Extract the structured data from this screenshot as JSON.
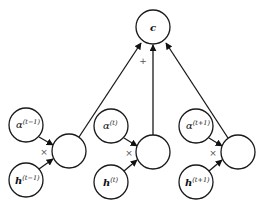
{
  "diagram": {
    "title": "",
    "output_node": {
      "label": "c",
      "cx": 153,
      "cy": 27,
      "r": 17
    },
    "sum_operator": "+",
    "product_operator": "×",
    "groups": [
      {
        "alpha": {
          "base": "α",
          "sup": "(t−1)",
          "cx": 26,
          "cy": 125,
          "r": 17
        },
        "h": {
          "base": "h",
          "sup": "(t−1)",
          "cx": 26,
          "cy": 180,
          "r": 17
        },
        "product": {
          "cx": 69,
          "cy": 151,
          "r": 17
        }
      },
      {
        "alpha": {
          "base": "α",
          "sup": "(t)",
          "cx": 111,
          "cy": 126,
          "r": 17
        },
        "h": {
          "base": "h",
          "sup": "(t)",
          "cx": 111,
          "cy": 182,
          "r": 17
        },
        "product": {
          "cx": 153,
          "cy": 152,
          "r": 17
        }
      },
      {
        "alpha": {
          "base": "α",
          "sup": "(t+1)",
          "cx": 196,
          "cy": 126,
          "r": 17
        },
        "h": {
          "base": "h",
          "sup": "(t+1)",
          "cx": 196,
          "cy": 182,
          "r": 17
        },
        "product": {
          "cx": 238,
          "cy": 152,
          "r": 17
        }
      }
    ]
  }
}
